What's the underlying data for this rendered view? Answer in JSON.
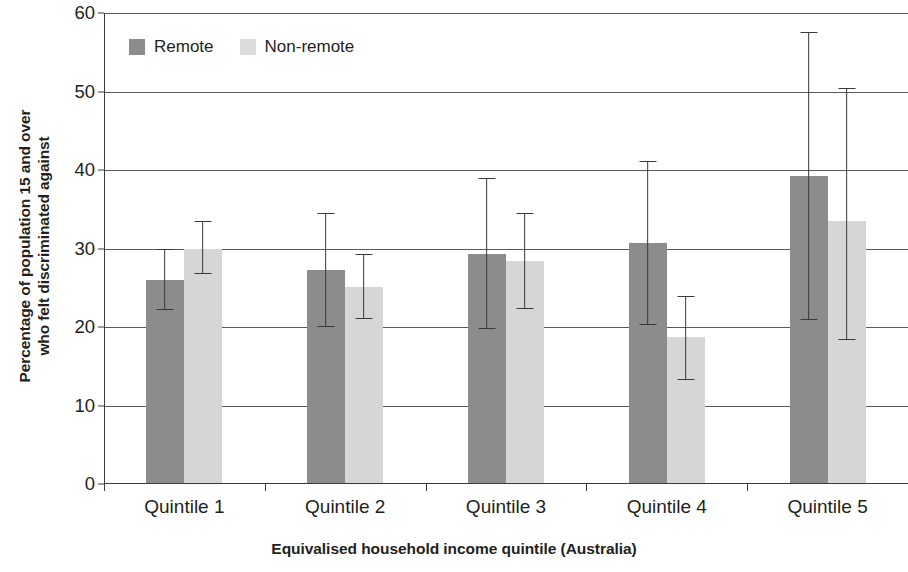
{
  "chart_data": {
    "type": "bar",
    "title": "",
    "subtitle": "",
    "xlabel": "Equivalised household income quintile (Australia)",
    "ylabel": "Percentage of population 15 and over who felt discriminated against",
    "ylabel_lines": [
      "Percentage of population 15 and over",
      "who felt discriminated against"
    ],
    "categories": [
      "Quintile 1",
      "Quintile 2",
      "Quintile 3",
      "Quintile 4",
      "Quintile 5"
    ],
    "ylim": [
      0,
      60
    ],
    "yticks": [
      0,
      10,
      20,
      30,
      40,
      50,
      60
    ],
    "ytick_labels": [
      "0",
      "10",
      "20",
      "30",
      "40",
      "50",
      "60"
    ],
    "grid": true,
    "grid_axis": "y",
    "legend_position": "top-left-inside",
    "error_bars": "95% confidence interval",
    "series": [
      {
        "name": "Remote",
        "color": "#8c8c8c",
        "values": [
          26.0,
          27.2,
          29.3,
          30.7,
          39.3
        ],
        "ci_low": [
          22.2,
          20.0,
          19.8,
          20.2,
          20.9
        ],
        "ci_high": [
          30.0,
          34.5,
          39.0,
          41.2,
          57.6
        ]
      },
      {
        "name": "Non-remote",
        "color": "#d6d6d6",
        "values": [
          30.0,
          25.1,
          28.4,
          18.7,
          33.5
        ],
        "ci_low": [
          26.8,
          21.0,
          22.3,
          13.3,
          18.4
        ],
        "ci_high": [
          33.5,
          29.3,
          34.5,
          23.9,
          50.5
        ]
      }
    ]
  }
}
